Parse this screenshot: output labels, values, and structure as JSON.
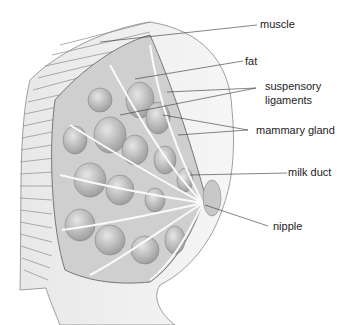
{
  "diagram": {
    "labels": {
      "muscle": "muscle",
      "fat": "fat",
      "suspensory_1": "suspensory",
      "suspensory_2": "ligaments",
      "mammary_gland": "mammary gland",
      "milk_duct": "milk duct",
      "nipple": "nipple"
    }
  }
}
